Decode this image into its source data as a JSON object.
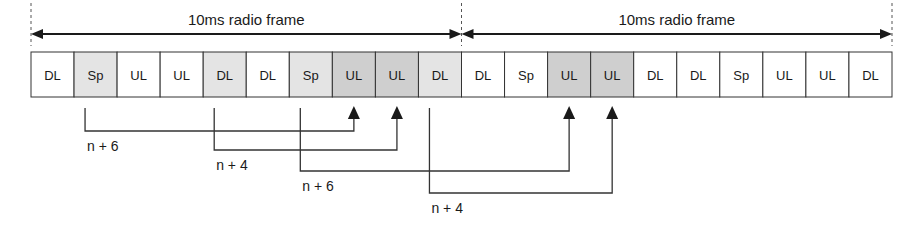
{
  "diagram": {
    "frames": [
      {
        "label": "10ms radio frame",
        "x_start": 31,
        "x_end": 462
      },
      {
        "label": "10ms radio frame",
        "x_start": 462,
        "x_end": 892
      }
    ],
    "subframes": [
      {
        "label": "DL",
        "shade": "white"
      },
      {
        "label": "Sp",
        "shade": "light"
      },
      {
        "label": "UL",
        "shade": "white"
      },
      {
        "label": "UL",
        "shade": "white"
      },
      {
        "label": "DL",
        "shade": "light"
      },
      {
        "label": "DL",
        "shade": "white"
      },
      {
        "label": "Sp",
        "shade": "light"
      },
      {
        "label": "UL",
        "shade": "dark"
      },
      {
        "label": "UL",
        "shade": "dark"
      },
      {
        "label": "DL",
        "shade": "light"
      },
      {
        "label": "DL",
        "shade": "white"
      },
      {
        "label": "Sp",
        "shade": "white"
      },
      {
        "label": "UL",
        "shade": "dark"
      },
      {
        "label": "UL",
        "shade": "dark"
      },
      {
        "label": "DL",
        "shade": "white"
      },
      {
        "label": "DL",
        "shade": "white"
      },
      {
        "label": "Sp",
        "shade": "white"
      },
      {
        "label": "UL",
        "shade": "white"
      },
      {
        "label": "UL",
        "shade": "white"
      },
      {
        "label": "DL",
        "shade": "white"
      }
    ],
    "timing_links": [
      {
        "label": "n + 6",
        "from_subframe": 1,
        "to_subframe": 7
      },
      {
        "label": "n + 4",
        "from_subframe": 4,
        "to_subframe": 8
      },
      {
        "label": "n + 6",
        "from_subframe": 6,
        "to_subframe": 12
      },
      {
        "label": "n + 4",
        "from_subframe": 9,
        "to_subframe": 13
      }
    ],
    "colors": {
      "white": "#ffffff",
      "light": "#e4e4e4",
      "dark": "#cfcfcf",
      "stroke": "#333333"
    }
  }
}
